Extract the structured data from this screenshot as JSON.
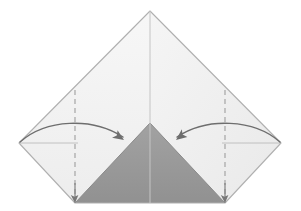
{
  "figure": {
    "kind": "origami-fold-diagram",
    "canvas": {
      "width": 301,
      "height": 211,
      "background": "#ffffff"
    }
  },
  "colors": {
    "paper_light": "#f2f2f2",
    "paper_light_shadow": "#eaeaea",
    "paper_dark": "#9a9a9a",
    "paper_dark_shadow": "#8f8f8f",
    "outline": "#b9b9b9",
    "outline_strong": "#a9a9a9",
    "crease_solid": "#c8c8c8",
    "crease_dashed": "#9e9e9e",
    "arrow": "#6e6e6e"
  },
  "geometry": {
    "apex": {
      "x": 150,
      "y": 11
    },
    "left_vertex": {
      "x": 19,
      "y": 143
    },
    "right_vertex": {
      "x": 281,
      "y": 143
    },
    "bottom_left": {
      "x": 75,
      "y": 203
    },
    "bottom_right": {
      "x": 225,
      "y": 203
    },
    "dark_triangle_apex": {
      "x": 150,
      "y": 123
    },
    "center_line_x": 150,
    "fold_line_left_x": 75,
    "fold_line_right_x": 225,
    "fold_line_top_y": 90,
    "fold_line_bottom_y": 203,
    "horizontal_guide_y": 143
  },
  "shapes": {
    "outer_silhouette": {
      "name": "folded-paper-outline",
      "points": "150,11 281,143 225,203 75,203 19,143"
    },
    "left_upper_panel": {
      "name": "left-upper-panel",
      "points": "150,11 150,203 75,203 19,143"
    },
    "right_upper_panel": {
      "name": "right-upper-panel",
      "points": "150,11 281,143 225,203 150,203"
    },
    "dark_center_triangle": {
      "name": "dark-center-triangle",
      "points": "150,123 225,203 75,203"
    }
  },
  "creases": [
    {
      "id": "center-vertical",
      "style": "solid",
      "x1": 150,
      "y1": 11,
      "x2": 150,
      "y2": 203
    },
    {
      "id": "left-fold",
      "style": "dashed",
      "x1": 75,
      "y1": 90,
      "x2": 75,
      "y2": 203
    },
    {
      "id": "right-fold",
      "style": "dashed",
      "x1": 225,
      "y1": 90,
      "x2": 225,
      "y2": 203
    },
    {
      "id": "left-horizontal-guide",
      "style": "thin-solid",
      "x1": 19,
      "y1": 143,
      "x2": 78,
      "y2": 143
    },
    {
      "id": "right-horizontal-guide",
      "style": "thin-solid",
      "x1": 222,
      "y1": 143,
      "x2": 281,
      "y2": 143
    }
  ],
  "arrows": [
    {
      "id": "left-fold-arrow",
      "label": "fold left corner in",
      "direction": "left-to-right",
      "path": "M 20,142 C 46,119 92,117 123,137",
      "head_at": {
        "x": 124,
        "y": 140
      },
      "head_angle_deg": 36
    },
    {
      "id": "right-fold-arrow",
      "label": "fold right corner in",
      "direction": "right-to-left",
      "path": "M 280,142 C 254,119 207,117 177,137",
      "head_at": {
        "x": 176,
        "y": 140
      },
      "head_angle_deg": 144
    },
    {
      "id": "left-corner-down-arrow",
      "label": "left corner lands here",
      "direction": "down",
      "path": "M 75,183 L 75,200",
      "head_at": {
        "x": 75,
        "y": 202
      },
      "head_angle_deg": 90
    },
    {
      "id": "right-corner-down-arrow",
      "label": "right corner lands here",
      "direction": "down",
      "path": "M 225,183 L 225,200",
      "head_at": {
        "x": 225,
        "y": 202
      },
      "head_angle_deg": 90
    }
  ]
}
